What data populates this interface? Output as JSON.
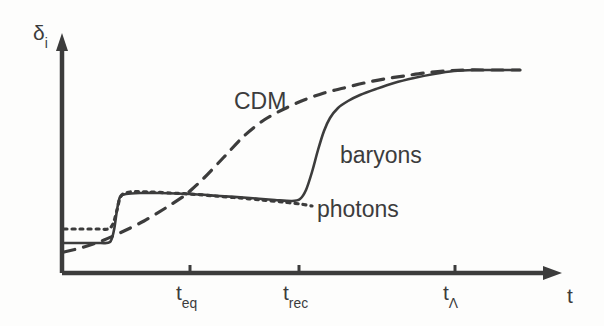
{
  "chart_data": {
    "type": "line",
    "title": "",
    "subtitle": "",
    "xlabel": "t",
    "ylabel": "δ",
    "ylabel_sub": "i",
    "grid": false,
    "legend_position": "inline-annotations",
    "axis_style": "arrow-axes-no-numeric-ticks",
    "xlim": [
      0,
      1
    ],
    "ylim": [
      0,
      1
    ],
    "x_ticks": [
      {
        "name": "t_eq",
        "base": "t",
        "sub": "eq",
        "pixel_x": 190
      },
      {
        "name": "t_rec",
        "base": "t",
        "sub": "rec",
        "pixel_x": 299
      },
      {
        "name": "t_L",
        "base": "t",
        "sub": "Λ",
        "pixel_x": 455
      }
    ],
    "annotations": [
      {
        "text": "CDM",
        "x": 234,
        "y": 90
      },
      {
        "text": "baryons",
        "x": 340,
        "y": 144
      },
      {
        "text": "photons",
        "x": 317,
        "y": 198
      }
    ],
    "series": [
      {
        "name": "CDM",
        "style": "dashed",
        "color": "#3c3c3c",
        "description": "Cold dark matter perturbation grows steadily from before equality, rising through the baryon plateau at t_eq and flattening after t_Lambda",
        "points": [
          [
            64,
            252
          ],
          [
            84,
            247
          ],
          [
            104,
            240
          ],
          [
            124,
            231
          ],
          [
            144,
            221
          ],
          [
            164,
            209
          ],
          [
            184,
            196
          ],
          [
            190,
            191
          ],
          [
            204,
            178
          ],
          [
            224,
            157
          ],
          [
            244,
            136
          ],
          [
            264,
            120
          ],
          [
            284,
            109
          ],
          [
            304,
            100
          ],
          [
            324,
            93
          ],
          [
            344,
            88
          ],
          [
            364,
            83
          ],
          [
            384,
            79
          ],
          [
            404,
            76
          ],
          [
            424,
            73
          ],
          [
            444,
            71
          ],
          [
            464,
            70
          ],
          [
            484,
            70
          ],
          [
            504,
            70
          ],
          [
            520,
            70
          ]
        ]
      },
      {
        "name": "baryons",
        "style": "solid",
        "color": "#3c3c3c",
        "description": "Baryons locked to photons at low amplitude, jump at first acoustic feature, plateau until recombination, then rapidly catch up to CDM",
        "points": [
          [
            64,
            243
          ],
          [
            80,
            243
          ],
          [
            100,
            243
          ],
          [
            110,
            242
          ],
          [
            114,
            230
          ],
          [
            117,
            210
          ],
          [
            120,
            197
          ],
          [
            126,
            194
          ],
          [
            140,
            193
          ],
          [
            160,
            193
          ],
          [
            190,
            194
          ],
          [
            220,
            196
          ],
          [
            250,
            198
          ],
          [
            275,
            200
          ],
          [
            292,
            201
          ],
          [
            300,
            199
          ],
          [
            306,
            190
          ],
          [
            312,
            172
          ],
          [
            318,
            150
          ],
          [
            324,
            131
          ],
          [
            330,
            118
          ],
          [
            338,
            108
          ],
          [
            348,
            101
          ],
          [
            360,
            95
          ],
          [
            376,
            89
          ],
          [
            394,
            83
          ],
          [
            414,
            78
          ],
          [
            434,
            74
          ],
          [
            454,
            71
          ],
          [
            474,
            70
          ],
          [
            494,
            70
          ],
          [
            520,
            70
          ]
        ]
      },
      {
        "name": "photons",
        "style": "dotted",
        "color": "#3c3c3c",
        "description": "Photon perturbation tracks baryons before recombination at slightly higher initial amplitude, then falls away after decoupling",
        "points": [
          [
            64,
            229
          ],
          [
            80,
            229
          ],
          [
            98,
            229
          ],
          [
            108,
            229
          ],
          [
            113,
            224
          ],
          [
            117,
            210
          ],
          [
            121,
            196
          ],
          [
            130,
            192
          ],
          [
            150,
            192
          ],
          [
            170,
            193
          ],
          [
            190,
            194
          ],
          [
            215,
            196
          ],
          [
            240,
            198
          ],
          [
            262,
            200
          ],
          [
            282,
            202
          ],
          [
            300,
            204
          ],
          [
            312,
            206
          ]
        ]
      }
    ]
  },
  "axes": {
    "y_axis": {
      "x": 62,
      "y_top": 38,
      "y_bottom": 273,
      "arrow": "up"
    },
    "x_axis": {
      "y": 273,
      "x_left": 62,
      "x_right": 560,
      "arrow": "right"
    },
    "tick_length": 8,
    "stroke_color": "#3c3c3c"
  },
  "labels": {
    "y_axis_symbol": "δ",
    "y_axis_subscript": "i",
    "x_axis_symbol": "t",
    "tick_teq_base": "t",
    "tick_teq_sub": "eq",
    "tick_trec_base": "t",
    "tick_trec_sub": "rec",
    "tick_tlambda_base": "t",
    "tick_tlambda_sub": "Λ",
    "curve_cdm": "CDM",
    "curve_baryons": "baryons",
    "curve_photons": "photons"
  },
  "colors": {
    "ink": "#3c3c3c",
    "background": "#fdfdfc"
  }
}
